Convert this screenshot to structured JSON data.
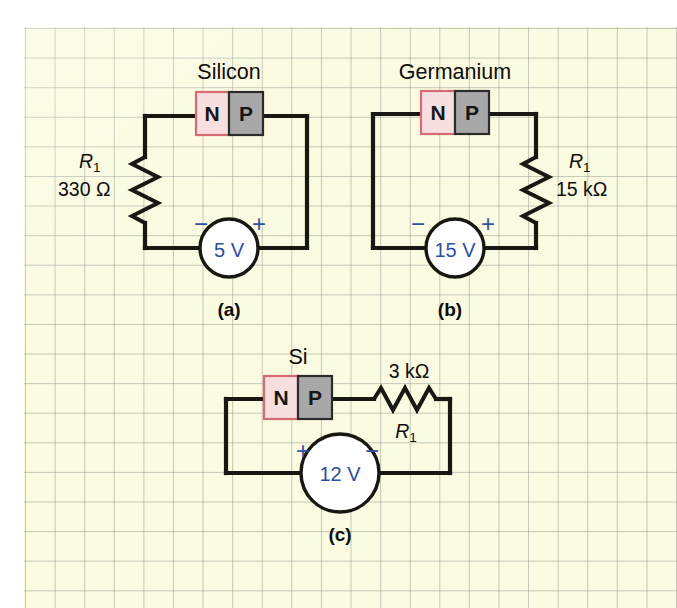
{
  "figure": {
    "background_color": "#fafbe0",
    "grid_line_color": "#969e96",
    "wire_color": "#191712",
    "accent_blue": "#2f4f9e",
    "n_block_color": "#f7dfe0",
    "p_block_color": "#a8a8a8"
  },
  "circuits": [
    {
      "caption": "(a)",
      "material_label": "Silicon",
      "diode": {
        "n_label": "N",
        "p_label": "P"
      },
      "resistor": {
        "designator": "R",
        "subscript": "1",
        "value": "330 Ω",
        "orientation": "vertical",
        "position": "left"
      },
      "source": {
        "value": "5 V",
        "left_sign": "−",
        "right_sign": "+"
      }
    },
    {
      "caption": "(b)",
      "material_label": "Germanium",
      "diode": {
        "n_label": "N",
        "p_label": "P"
      },
      "resistor": {
        "designator": "R",
        "subscript": "1",
        "value": "15 kΩ",
        "orientation": "vertical",
        "position": "right"
      },
      "source": {
        "value": "15 V",
        "left_sign": "−",
        "right_sign": "+"
      }
    },
    {
      "caption": "(c)",
      "material_label": "Si",
      "diode": {
        "n_label": "N",
        "p_label": "P"
      },
      "resistor": {
        "designator": "R",
        "subscript": "1",
        "value": "3 kΩ",
        "orientation": "horizontal",
        "position": "top-right"
      },
      "source": {
        "value": "12 V",
        "left_sign": "+",
        "right_sign": "−"
      }
    }
  ]
}
